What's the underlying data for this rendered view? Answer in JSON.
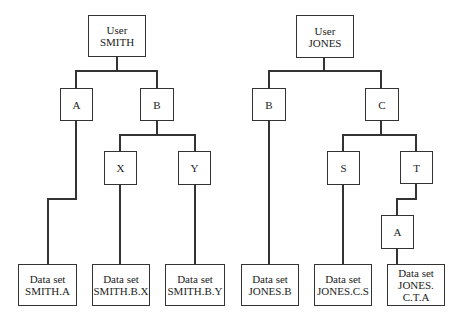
{
  "trees": [
    {
      "user": {
        "line1": "User",
        "line2": "SMITH"
      },
      "nodes": {
        "a": "A",
        "b": "B",
        "x": "X",
        "y": "Y"
      },
      "datasets": [
        {
          "line1": "Data set",
          "line2": "SMITH.A"
        },
        {
          "line1": "Data set",
          "line2": "SMITH.B.X"
        },
        {
          "line1": "Data set",
          "line2": "SMITH.B.Y"
        }
      ]
    },
    {
      "user": {
        "line1": "User",
        "line2": "JONES"
      },
      "nodes": {
        "b": "B",
        "c": "C",
        "s": "S",
        "t": "T",
        "a": "A"
      },
      "datasets": [
        {
          "line1": "Data set",
          "line2": "JONES.B"
        },
        {
          "line1": "Data set",
          "line2": "JONES.C.S"
        },
        {
          "line1": "Data set",
          "line2": "JONES.",
          "line3": "C.T.A"
        }
      ]
    }
  ]
}
